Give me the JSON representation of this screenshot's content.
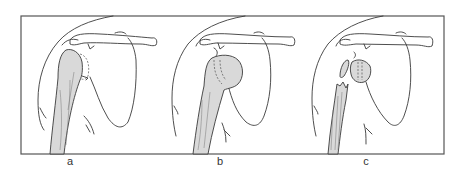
{
  "figure": {
    "frame": {
      "x": 21,
      "y": 16,
      "width": 423,
      "height": 138,
      "stroke": "#555555"
    },
    "colors": {
      "line": "#3a3a3a",
      "bone_fill": "#d9d9d9",
      "background": "#ffffff"
    },
    "panels": [
      {
        "id": "a",
        "label": "a",
        "description": "Shoulder with humeral head intact; dashed outline of articular surface"
      },
      {
        "id": "b",
        "label": "b",
        "description": "Shoulder with rounded humeral head (prosthetic outline dashed)"
      },
      {
        "id": "c",
        "label": "c",
        "description": "Fractured proximal humerus with separated head and tuberosity fragments"
      }
    ]
  }
}
